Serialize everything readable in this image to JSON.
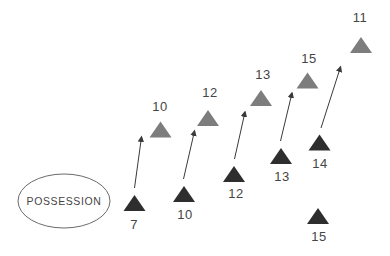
{
  "diagram": {
    "source": {
      "label": "POSSESSION"
    },
    "colors": {
      "background": "#ffffff",
      "dark_triangle": "#2e2e2e",
      "gray_triangle": "#7d7d7d",
      "arrow": "#3a3a3a",
      "ellipse_outline": "#6b6b6b"
    },
    "pairs": [
      {
        "bottom_label": "7",
        "top_label": "10"
      },
      {
        "bottom_label": "10",
        "top_label": "12"
      },
      {
        "bottom_label": "12",
        "top_label": "13"
      },
      {
        "bottom_label": "13",
        "top_label": "15"
      },
      {
        "bottom_label": "14",
        "top_label": "11"
      }
    ],
    "isolated": {
      "label": "15"
    }
  }
}
